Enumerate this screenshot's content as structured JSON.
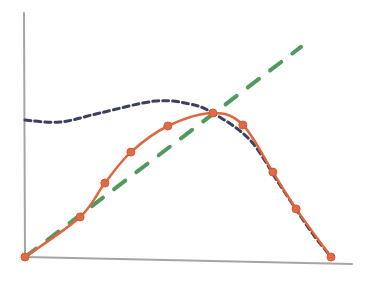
{
  "chart_data": {
    "type": "line",
    "title": "",
    "xlabel": "",
    "ylabel": "",
    "xlim": [
      0,
      1
    ],
    "ylim": [
      0,
      1
    ],
    "grid": false,
    "legend": "none",
    "style": "hand-drawn sketch",
    "series": [
      {
        "name": "dotted curve",
        "color": "#3d3f5e",
        "line_style": "dotted",
        "markers": false,
        "x": [
          0,
          0.114,
          0.245,
          0.425,
          0.539,
          0.614,
          0.735,
          0.833,
          0.931,
          1.0
        ],
        "y": [
          0.561,
          0.553,
          0.59,
          0.639,
          0.627,
          0.59,
          0.48,
          0.295,
          0.111,
          0
        ]
      },
      {
        "name": "dashed line",
        "color": "#4f9a5e",
        "line_style": "dashed",
        "markers": false,
        "x": [
          0,
          0.902
        ],
        "y": [
          0,
          0.861
        ]
      },
      {
        "name": "solid curve with markers",
        "color": "#e0663e",
        "line_style": "solid",
        "markers": true,
        "x": [
          0,
          0.18,
          0.261,
          0.346,
          0.467,
          0.614,
          0.712,
          0.81,
          0.886,
          1.0
        ],
        "y": [
          0,
          0.164,
          0.303,
          0.43,
          0.537,
          0.59,
          0.541,
          0.348,
          0.197,
          0
        ]
      }
    ]
  }
}
